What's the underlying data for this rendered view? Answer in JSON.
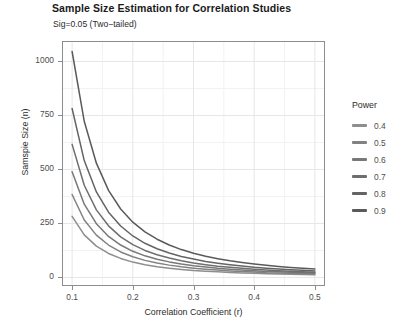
{
  "chart_data": {
    "type": "line",
    "title": "Sample Size Estimation for Correlation Studies",
    "subtitle": "Sig=0.05 (Two−tailed)",
    "xlabel": "Correlation Coefficient (r)",
    "ylabel": "Samspie Size (n)",
    "xlim": [
      0.085,
      0.515
    ],
    "ylim": [
      -35,
      1090
    ],
    "xticks": [
      "0.1",
      "0.2",
      "0.3",
      "0.4",
      "0.5"
    ],
    "xtick_values": [
      0.1,
      0.2,
      0.3,
      0.4,
      0.5
    ],
    "yticks": [
      "0",
      "250",
      "500",
      "750",
      "1000"
    ],
    "ytick_values": [
      0,
      250,
      500,
      750,
      1000
    ],
    "grid": true,
    "grid_minor": true,
    "legend_title": "Power",
    "legend_position": "right",
    "x": [
      0.1,
      0.12,
      0.14,
      0.16,
      0.18,
      0.2,
      0.22,
      0.24,
      0.26,
      0.28,
      0.3,
      0.32,
      0.34,
      0.36,
      0.38,
      0.4,
      0.42,
      0.44,
      0.46,
      0.48,
      0.5
    ],
    "series": [
      {
        "name": "0.4",
        "color": "#8e8e8e",
        "values": [
          283,
          197,
          145,
          111,
          88,
          71,
          59,
          50,
          43,
          37,
          32,
          29,
          26,
          23,
          21,
          19,
          17,
          16,
          15,
          14,
          13
        ]
      },
      {
        "name": "0.5",
        "color": "#828282",
        "values": [
          384,
          266,
          196,
          150,
          118,
          96,
          79,
          67,
          57,
          49,
          43,
          38,
          34,
          30,
          27,
          25,
          22,
          21,
          19,
          18,
          17
        ]
      },
      {
        "name": "0.6",
        "color": "#787878",
        "values": [
          489,
          339,
          249,
          190,
          150,
          121,
          100,
          84,
          72,
          62,
          54,
          48,
          42,
          38,
          34,
          31,
          28,
          26,
          24,
          22,
          20
        ]
      },
      {
        "name": "0.7",
        "color": "#6e6e6e",
        "values": [
          616,
          427,
          313,
          239,
          188,
          152,
          125,
          105,
          90,
          77,
          67,
          59,
          52,
          47,
          42,
          38,
          34,
          31,
          29,
          26,
          24
        ]
      },
      {
        "name": "0.8",
        "color": "#646464",
        "values": [
          782,
          541,
          396,
          302,
          238,
          192,
          158,
          133,
          113,
          97,
          85,
          74,
          66,
          59,
          53,
          47,
          43,
          39,
          36,
          33,
          30
        ]
      },
      {
        "name": "0.9",
        "color": "#5a5a5a",
        "values": [
          1046,
          723,
          529,
          403,
          317,
          256,
          211,
          177,
          150,
          129,
          112,
          98,
          87,
          77,
          69,
          62,
          56,
          51,
          46,
          42,
          39
        ]
      }
    ]
  },
  "legend": {
    "title": "Power",
    "items": [
      {
        "label": "0.4"
      },
      {
        "label": "0.5"
      },
      {
        "label": "0.6"
      },
      {
        "label": "0.7"
      },
      {
        "label": "0.8"
      },
      {
        "label": "0.9"
      }
    ]
  }
}
